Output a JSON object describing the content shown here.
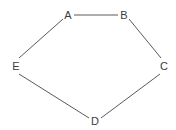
{
  "diagram": {
    "type": "graph",
    "nodes": [
      {
        "id": "A",
        "label": "A",
        "x": 68,
        "y": 15
      },
      {
        "id": "B",
        "label": "B",
        "x": 124,
        "y": 15
      },
      {
        "id": "C",
        "label": "C",
        "x": 164,
        "y": 66
      },
      {
        "id": "D",
        "label": "D",
        "x": 95,
        "y": 121
      },
      {
        "id": "E",
        "label": "E",
        "x": 16,
        "y": 66
      }
    ],
    "edges": [
      {
        "from": "A",
        "to": "B"
      },
      {
        "from": "B",
        "to": "C"
      },
      {
        "from": "C",
        "to": "D"
      },
      {
        "from": "D",
        "to": "E"
      },
      {
        "from": "E",
        "to": "A"
      }
    ],
    "colors": {
      "edge": "#5a5a5a",
      "label": "#3c3c3c",
      "background": "#ffffff"
    }
  }
}
